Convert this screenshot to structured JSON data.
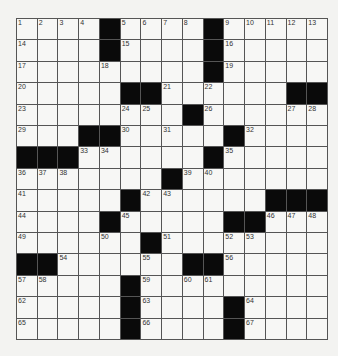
{
  "puzzle": {
    "rows": 15,
    "cols": 15,
    "grid": [
      [
        "1",
        "2",
        "3",
        "4",
        "#",
        "5",
        "6",
        "7",
        "8",
        "#",
        "9",
        "10",
        "11",
        "12",
        "13"
      ],
      [
        "14",
        "",
        "",
        "",
        "#",
        "15",
        "",
        "",
        "",
        "#",
        "16",
        "",
        "",
        "",
        ""
      ],
      [
        "17",
        "",
        "",
        "",
        "18",
        "",
        "",
        "",
        "",
        "#",
        "19",
        "",
        "",
        "",
        ""
      ],
      [
        "20",
        "",
        "",
        "",
        "",
        "#",
        "#",
        "21",
        "",
        "22",
        "",
        "",
        "",
        "#",
        "#"
      ],
      [
        "23",
        "",
        "",
        "",
        "",
        "24",
        "25",
        "",
        "#",
        "26",
        "",
        "",
        "",
        "27",
        "28"
      ],
      [
        "29",
        "",
        "",
        "#",
        "#",
        "30",
        "",
        "31",
        "",
        "",
        "#",
        "32",
        "",
        "",
        ""
      ],
      [
        "#",
        "#",
        "#",
        "33",
        "34",
        "",
        "",
        "",
        "",
        "#",
        "35",
        "",
        "",
        "",
        ""
      ],
      [
        "36",
        "37",
        "38",
        "",
        "",
        "",
        "",
        "#",
        "39",
        "40",
        "",
        "",
        "",
        "",
        ""
      ],
      [
        "41",
        "",
        "",
        "",
        "",
        "#",
        "42",
        "43",
        "",
        "",
        "",
        "",
        "#",
        "#",
        "#"
      ],
      [
        "44",
        "",
        "",
        "",
        "#",
        "45",
        "",
        "",
        "",
        "",
        "#",
        "#",
        "46",
        "47",
        "48"
      ],
      [
        "49",
        "",
        "",
        "",
        "50",
        "",
        "#",
        "51",
        "",
        "",
        "52",
        "53",
        "",
        "",
        ""
      ],
      [
        "#",
        "#",
        "54",
        "",
        "",
        "",
        "55",
        "",
        "#",
        "#",
        "56",
        "",
        "",
        "",
        ""
      ],
      [
        "57",
        "58",
        "",
        "",
        "",
        "#",
        "59",
        "",
        "60",
        "61",
        "",
        "",
        "",
        "",
        ""
      ],
      [
        "62",
        "",
        "",
        "",
        "",
        "#",
        "63",
        "",
        "",
        "",
        "#",
        "64",
        "",
        "",
        ""
      ],
      [
        "65",
        "",
        "",
        "",
        "",
        "#",
        "66",
        "",
        "",
        "",
        "#",
        "67",
        "",
        "",
        ""
      ]
    ]
  }
}
